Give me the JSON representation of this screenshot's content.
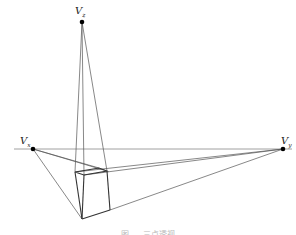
{
  "diagram": {
    "vanishing_points": [
      {
        "id": "Vz",
        "label": "V",
        "sub": "z",
        "x": 82,
        "y": 22
      },
      {
        "id": "Vx",
        "label": "V",
        "sub": "x",
        "x": 33,
        "y": 149
      },
      {
        "id": "Vy",
        "label": "V",
        "sub": "y",
        "x": 283,
        "y": 149
      }
    ],
    "horizon": {
      "x1": 14,
      "y1": 149,
      "x2": 292,
      "y2": 149
    },
    "box": {
      "top": [
        [
          75,
          172
        ],
        [
          84,
          175
        ],
        [
          107,
          171
        ],
        [
          99,
          168
        ]
      ],
      "bottom": [
        [
          82,
          219
        ],
        [
          110,
          210
        ]
      ]
    },
    "colors": {
      "line": "#555555",
      "box": "#333333",
      "point": "#000000"
    },
    "caption": "图 … 三点透视"
  }
}
